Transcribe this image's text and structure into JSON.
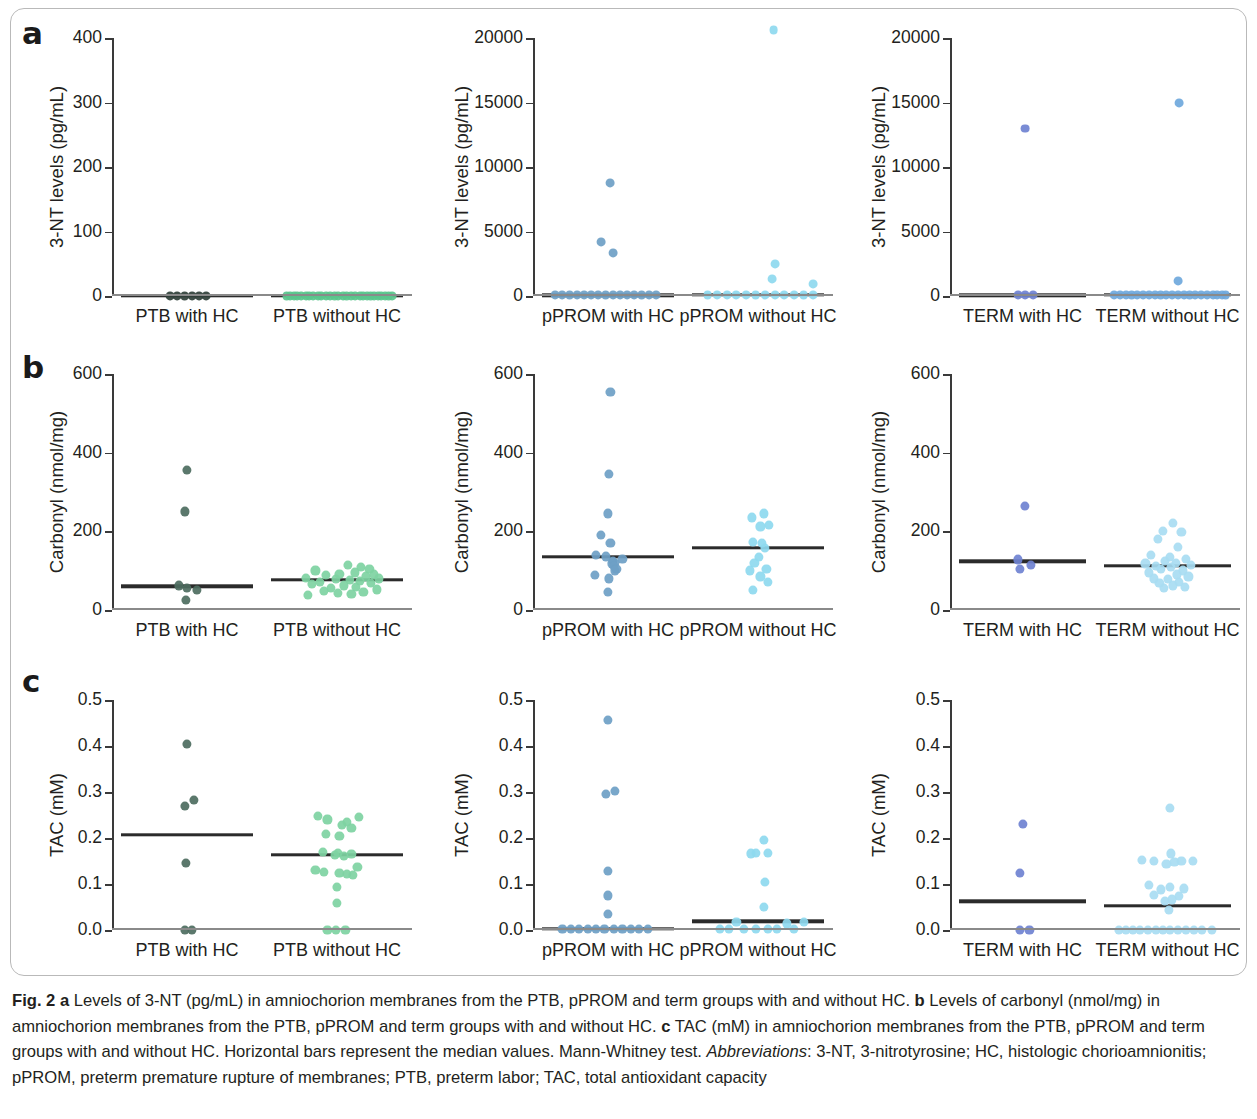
{
  "figure": {
    "panel_letters": [
      "a",
      "b",
      "c"
    ],
    "caption_segments": [
      {
        "text": "Fig. 2",
        "style": "bold"
      },
      {
        "text": " ",
        "style": "normal"
      },
      {
        "text": "a",
        "style": "bold"
      },
      {
        "text": " Levels of 3-NT (pg/mL) in amniochorion membranes from the PTB, pPROM and term groups with and without HC. ",
        "style": "normal"
      },
      {
        "text": "b",
        "style": "bold"
      },
      {
        "text": " Levels of carbonyl (nmol/mg) in amniochorion membranes from the PTB, pPROM and term groups with and without HC. ",
        "style": "normal"
      },
      {
        "text": "c",
        "style": "bold"
      },
      {
        "text": " TAC (mM) in amniochorion membranes from the PTB, pPROM and term groups with and without HC. Horizontal bars represent the median values. Mann-Whitney test. ",
        "style": "normal"
      },
      {
        "text": "Abbreviations",
        "style": "italic"
      },
      {
        "text": ": 3-NT, 3-nitrotyrosine; HC, histologic chorioamnionitis; pPROM, preterm premature rupture of membranes; PTB, preterm labor; TAC, total antioxidant capacity",
        "style": "normal"
      }
    ]
  },
  "colors": {
    "dark_green": "#4d6d60",
    "light_green": "#7ed3a2",
    "medium_blue": "#6e9fc6",
    "light_cyan": "#8ed9ef",
    "periwinkle": "#6f82d1",
    "light_blue": "#a8dcf2",
    "median_bar": "#2b2b2b",
    "axis": "#3a3a3a",
    "frame": "#b9b9b9"
  },
  "chart_data": [
    {
      "id": "a1",
      "row": "a",
      "type": "scatter",
      "ylabel": "3-NT levels (pg/mL)",
      "ylim": [
        0,
        400
      ],
      "yticks": [
        0,
        100,
        200,
        300,
        400
      ],
      "ytick_labels": [
        "0",
        "100",
        "200",
        "300",
        "400"
      ],
      "groups": [
        {
          "name": "PTB with HC",
          "color": "#2f3f38",
          "median": 0,
          "values": [
            0,
            0,
            0,
            0,
            0,
            0
          ],
          "jitter": [
            -0.14,
            -0.08,
            -0.02,
            0.04,
            0.1,
            0.16
          ]
        },
        {
          "name": "PTB without HC",
          "color": "#59c68c",
          "median": 0,
          "values": [
            0,
            0,
            0,
            0,
            0,
            0,
            0,
            0,
            0,
            0,
            0,
            0,
            0,
            0,
            0,
            0,
            0,
            0,
            0,
            0,
            0,
            0,
            0,
            0,
            0,
            0,
            0,
            0
          ],
          "jitter": [
            -0.42,
            -0.39,
            -0.36,
            -0.33,
            -0.3,
            -0.26,
            -0.23,
            -0.2,
            -0.16,
            -0.13,
            -0.09,
            -0.06,
            -0.02,
            0.01,
            0.05,
            0.08,
            0.12,
            0.15,
            0.19,
            0.22,
            0.25,
            0.28,
            0.31,
            0.34,
            0.37,
            0.4,
            0.43,
            0.46
          ]
        }
      ]
    },
    {
      "id": "a2",
      "row": "a",
      "type": "scatter",
      "ylabel": "3-NT levels (pg/mL)",
      "ylim": [
        0,
        20000
      ],
      "yticks": [
        0,
        5000,
        10000,
        15000,
        20000
      ],
      "ytick_labels": [
        "0",
        "5000",
        "10000",
        "15000",
        "20000"
      ],
      "groups": [
        {
          "name": "pPROM with HC",
          "color": "#6e9fc6",
          "median": 60,
          "values": [
            8750,
            4200,
            3350,
            60,
            60,
            60,
            60,
            60,
            60,
            60,
            60,
            60,
            60,
            60,
            60,
            60,
            60,
            60
          ],
          "jitter": [
            0.02,
            -0.06,
            0.04,
            -0.44,
            -0.38,
            -0.32,
            -0.26,
            -0.2,
            -0.14,
            -0.08,
            -0.02,
            0.04,
            0.1,
            0.16,
            0.22,
            0.28,
            0.34,
            0.4
          ]
        },
        {
          "name": "pPROM without HC",
          "color": "#8ed9ef",
          "median": 70,
          "values": [
            20600,
            2500,
            1350,
            950,
            70,
            70,
            70,
            70,
            70,
            70,
            70,
            70,
            70,
            70,
            70,
            70
          ],
          "jitter": [
            0.13,
            0.14,
            0.12,
            0.46,
            -0.42,
            -0.34,
            -0.26,
            -0.18,
            -0.1,
            -0.02,
            0.06,
            0.14,
            0.22,
            0.3,
            0.38,
            0.46
          ]
        }
      ]
    },
    {
      "id": "a3",
      "row": "a",
      "type": "scatter",
      "ylabel": "3-NT levels (pg/mL)",
      "ylim": [
        0,
        20000
      ],
      "yticks": [
        0,
        5000,
        10000,
        15000,
        20000
      ],
      "ytick_labels": [
        "0",
        "5000",
        "10000",
        "15000",
        "20000"
      ],
      "groups": [
        {
          "name": "TERM with HC",
          "color": "#6f82d1",
          "median": 60,
          "values": [
            13000,
            60,
            60,
            60
          ],
          "jitter": [
            0.02,
            -0.04,
            0.02,
            0.09
          ]
        },
        {
          "name": "TERM without HC",
          "color": "#6fa8dc",
          "median": 70,
          "values": [
            14950,
            1150,
            70,
            70,
            70,
            70,
            70,
            70,
            70,
            70,
            70,
            70,
            70,
            70,
            70,
            70,
            70,
            70,
            70,
            70,
            70,
            70,
            70
          ],
          "jitter": [
            0.1,
            0.09,
            -0.46,
            -0.41,
            -0.36,
            -0.31,
            -0.26,
            -0.21,
            -0.16,
            -0.11,
            -0.06,
            -0.01,
            0.04,
            0.09,
            0.14,
            0.19,
            0.24,
            0.29,
            0.34,
            0.39,
            0.43,
            0.47,
            0.5
          ]
        }
      ]
    },
    {
      "id": "b1",
      "row": "b",
      "type": "scatter",
      "ylabel": "Carbonyl (nmol/mg)",
      "ylim": [
        0,
        600
      ],
      "yticks": [
        0,
        200,
        400,
        600
      ],
      "ytick_labels": [
        "0",
        "200",
        "400",
        "600"
      ],
      "groups": [
        {
          "name": "PTB with HC",
          "color": "#4d6d60",
          "median": 60,
          "values": [
            355,
            250,
            62,
            55,
            50,
            25
          ],
          "jitter": [
            0.0,
            -0.02,
            -0.07,
            0.0,
            0.08,
            -0.01
          ]
        },
        {
          "name": "PTB without HC",
          "color": "#7ed3a2",
          "median": 76,
          "values": [
            115,
            110,
            105,
            100,
            95,
            92,
            90,
            88,
            85,
            82,
            80,
            78,
            76,
            74,
            72,
            68,
            65,
            62,
            58,
            55,
            52,
            48,
            45,
            42,
            40,
            38
          ],
          "jitter": [
            0.09,
            0.2,
            0.27,
            -0.18,
            0.15,
            0.02,
            0.31,
            -0.09,
            0.24,
            -0.26,
            0.35,
            -0.01,
            0.11,
            0.19,
            -0.14,
            0.28,
            -0.21,
            0.06,
            0.16,
            -0.05,
            0.33,
            -0.11,
            0.22,
            0.01,
            0.12,
            -0.24
          ]
        }
      ]
    },
    {
      "id": "b2",
      "row": "b",
      "type": "scatter",
      "ylabel": "Carbonyl (nmol/mg)",
      "ylim": [
        0,
        600
      ],
      "yticks": [
        0,
        200,
        400,
        600
      ],
      "ytick_labels": [
        "0",
        "200",
        "400",
        "600"
      ],
      "groups": [
        {
          "name": "pPROM with HC",
          "color": "#6e9fc6",
          "median": 136,
          "values": [
            555,
            345,
            245,
            190,
            170,
            140,
            136,
            130,
            125,
            120,
            118,
            112,
            105,
            100,
            88,
            80,
            45
          ],
          "jitter": [
            0.02,
            0.01,
            0.0,
            -0.06,
            0.02,
            -0.1,
            -0.02,
            0.12,
            0.04,
            0.06,
            0.03,
            0.05,
            0.07,
            0.06,
            -0.11,
            0.01,
            0.0
          ]
        },
        {
          "name": "pPROM without HC",
          "color": "#8ed9ef",
          "median": 158,
          "values": [
            245,
            235,
            215,
            212,
            172,
            170,
            158,
            135,
            120,
            105,
            100,
            85,
            70,
            50
          ],
          "jitter": [
            0.05,
            -0.05,
            0.09,
            0.02,
            -0.04,
            0.03,
            0.06,
            0.01,
            -0.03,
            0.07,
            -0.07,
            0.02,
            0.08,
            -0.04
          ]
        }
      ]
    },
    {
      "id": "b3",
      "row": "b",
      "type": "scatter",
      "ylabel": "Carbonyl (nmol/mg)",
      "ylim": [
        0,
        600
      ],
      "yticks": [
        0,
        200,
        400,
        600
      ],
      "ytick_labels": [
        "0",
        "200",
        "400",
        "600"
      ],
      "groups": [
        {
          "name": "TERM with HC",
          "color": "#6f82d1",
          "median": 124,
          "values": [
            265,
            128,
            115,
            105
          ],
          "jitter": [
            0.02,
            -0.04,
            0.07,
            -0.02
          ]
        },
        {
          "name": "TERM without HC",
          "color": "#a8dcf2",
          "median": 113,
          "values": [
            220,
            200,
            198,
            180,
            160,
            140,
            135,
            130,
            125,
            120,
            118,
            115,
            112,
            110,
            105,
            100,
            95,
            90,
            85,
            80,
            78,
            72,
            68,
            62,
            58,
            55
          ],
          "jitter": [
            0.05,
            -0.04,
            0.12,
            -0.08,
            0.09,
            -0.14,
            0.02,
            0.16,
            -0.02,
            0.07,
            -0.19,
            0.2,
            -0.1,
            0.03,
            -0.06,
            0.13,
            -0.16,
            0.08,
            0.18,
            -0.12,
            0.0,
            0.1,
            -0.07,
            0.05,
            0.15,
            -0.03
          ]
        }
      ]
    },
    {
      "id": "c1",
      "row": "c",
      "type": "scatter",
      "ylabel": "TAC (mM)",
      "ylim": [
        0.0,
        0.5
      ],
      "yticks": [
        0.0,
        0.1,
        0.2,
        0.3,
        0.4,
        0.5
      ],
      "ytick_labels": [
        "0.0",
        "0.1",
        "0.2",
        "0.3",
        "0.4",
        "0.5"
      ],
      "groups": [
        {
          "name": "PTB with HC",
          "color": "#4d6d60",
          "median": 0.207,
          "values": [
            0.405,
            0.282,
            0.27,
            0.145,
            0.0,
            0.0
          ],
          "jitter": [
            0.0,
            0.06,
            -0.02,
            -0.01,
            -0.02,
            0.04
          ]
        },
        {
          "name": "PTB without HC",
          "color": "#7ed3a2",
          "median": 0.163,
          "values": [
            0.247,
            0.245,
            0.24,
            0.235,
            0.228,
            0.222,
            0.208,
            0.205,
            0.17,
            0.168,
            0.165,
            0.163,
            0.16,
            0.136,
            0.13,
            0.126,
            0.124,
            0.122,
            0.12,
            0.094,
            0.058,
            0.0,
            0.0,
            0.0
          ],
          "jitter": [
            -0.16,
            0.18,
            -0.08,
            0.08,
            0.04,
            0.12,
            -0.09,
            0.02,
            -0.12,
            0.01,
            0.12,
            -0.02,
            0.06,
            0.17,
            -0.18,
            -0.11,
            0.02,
            0.08,
            0.13,
            0.0,
            0.0,
            -0.08,
            -0.01,
            0.07
          ]
        }
      ]
    },
    {
      "id": "c2",
      "row": "c",
      "type": "scatter",
      "ylabel": "TAC (mM)",
      "ylim": [
        0.0,
        0.5
      ],
      "yticks": [
        0.0,
        0.1,
        0.2,
        0.3,
        0.4,
        0.5
      ],
      "ytick_labels": [
        "0.0",
        "0.1",
        "0.2",
        "0.3",
        "0.4",
        "0.5"
      ],
      "groups": [
        {
          "name": "pPROM with HC",
          "color": "#6e9fc6",
          "median": 0.003,
          "values": [
            0.456,
            0.302,
            0.296,
            0.128,
            0.075,
            0.034,
            0.002,
            0.002,
            0.002,
            0.002,
            0.002,
            0.002,
            0.002,
            0.002,
            0.002,
            0.002,
            0.002
          ],
          "jitter": [
            0.0,
            0.06,
            -0.02,
            0.0,
            0.0,
            0.0,
            -0.38,
            -0.31,
            -0.24,
            -0.17,
            -0.1,
            -0.03,
            0.05,
            0.12,
            0.19,
            0.26,
            0.33
          ]
        },
        {
          "name": "pPROM without HC",
          "color": "#8ed9ef",
          "median": 0.019,
          "values": [
            0.196,
            0.168,
            0.168,
            0.166,
            0.105,
            0.05,
            0.018,
            0.014,
            0.018,
            0.002,
            0.002,
            0.002,
            0.002,
            0.002,
            0.002,
            0.002
          ],
          "jitter": [
            0.05,
            -0.02,
            0.08,
            -0.06,
            0.06,
            0.05,
            -0.18,
            0.24,
            0.38,
            -0.32,
            -0.24,
            -0.12,
            -0.02,
            0.08,
            0.16,
            0.3
          ]
        }
      ]
    },
    {
      "id": "c3",
      "row": "c",
      "type": "scatter",
      "ylabel": "TAC (mM)",
      "ylim": [
        0.0,
        0.5
      ],
      "yticks": [
        0.0,
        0.1,
        0.2,
        0.3,
        0.4,
        0.5
      ],
      "ytick_labels": [
        "0.0",
        "0.1",
        "0.2",
        "0.3",
        "0.4",
        "0.5"
      ],
      "groups": [
        {
          "name": "TERM with HC",
          "color": "#6f82d1",
          "median": 0.062,
          "values": [
            0.23,
            0.123,
            0.0,
            0.0
          ],
          "jitter": [
            0.0,
            -0.02,
            -0.02,
            0.06
          ]
        },
        {
          "name": "TERM without HC",
          "color": "#a8dcf2",
          "median": 0.053,
          "values": [
            0.265,
            0.166,
            0.152,
            0.15,
            0.15,
            0.15,
            0.148,
            0.143,
            0.098,
            0.094,
            0.09,
            0.088,
            0.076,
            0.074,
            0.066,
            0.062,
            0.044,
            0.0,
            0.0,
            0.0,
            0.0,
            0.0,
            0.0,
            0.0,
            0.0,
            0.0,
            0.0,
            0.0,
            0.0,
            0.0
          ],
          "jitter": [
            0.02,
            0.03,
            -0.22,
            -0.12,
            0.12,
            0.22,
            0.06,
            -0.01,
            -0.16,
            0.02,
            0.14,
            -0.06,
            -0.12,
            0.1,
            0.04,
            -0.02,
            0.01,
            -0.42,
            -0.36,
            -0.3,
            -0.24,
            -0.17,
            -0.1,
            -0.04,
            0.02,
            0.09,
            0.16,
            0.23,
            0.3,
            0.38
          ]
        }
      ]
    }
  ]
}
